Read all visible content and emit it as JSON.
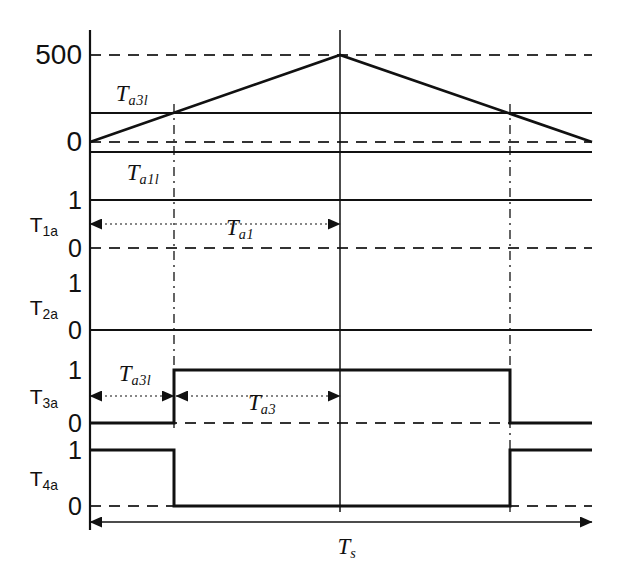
{
  "figure": {
    "type": "timing-diagram",
    "title_visible": false,
    "geometry": {
      "width": 617,
      "height": 576,
      "axis_x": 90,
      "right_edge": 592,
      "center_x": 340,
      "mark1_x": 174,
      "mark2_x": 510
    },
    "colors": {
      "line": "#111111",
      "dash": "#333333",
      "background": "#ffffff"
    }
  },
  "carrier": {
    "name": "triangular-carrier",
    "y_ticks": [
      {
        "label": "500",
        "y": 55
      },
      {
        "label": "0",
        "y": 142
      }
    ],
    "reference_levels": [
      {
        "name": "Ta3l-level",
        "y": 113
      },
      {
        "name": "Ta1l-level",
        "y": 152
      }
    ],
    "dashed_levels": [
      {
        "value": "500",
        "y": 55
      },
      {
        "value": "0",
        "y": 142
      }
    ],
    "waveform_points": [
      {
        "x": 90,
        "y": 142
      },
      {
        "x": 340,
        "y": 55
      },
      {
        "x": 592,
        "y": 142
      }
    ],
    "labels": [
      {
        "text": "T",
        "sub": "a3l",
        "x": 132,
        "y": 93
      },
      {
        "text": "T",
        "sub": "a1l",
        "x": 143,
        "y": 172
      }
    ]
  },
  "signals": [
    {
      "name": "T1a",
      "label_base": "T",
      "label_sub": "1a",
      "label_x": 58,
      "label_y": 224,
      "high_y": 200,
      "low_y": 248,
      "high_label": "1",
      "low_label": "0",
      "level_line_y": 200,
      "dashed_line_y": 248,
      "state": "high"
    },
    {
      "name": "T2a",
      "label_base": "T",
      "label_sub": "2a",
      "label_x": 58,
      "label_y": 307,
      "high_y": 283,
      "low_y": 330,
      "high_label": "1",
      "low_label": "0",
      "level_line_y": 330,
      "dashed_line_y": null,
      "state": "low"
    },
    {
      "name": "T3a",
      "label_base": "T",
      "label_sub": "3a",
      "label_x": 58,
      "label_y": 396,
      "high_y": 370,
      "low_y": 423,
      "high_label": "1",
      "low_label": "0",
      "dashed_line_y": 423,
      "state": "pulse-high-middle",
      "pulse": {
        "rise_x": 174,
        "fall_x": 510
      }
    },
    {
      "name": "T4a",
      "label_base": "T",
      "label_sub": "4a",
      "label_x": 58,
      "label_y": 478,
      "high_y": 450,
      "low_y": 506,
      "high_label": "1",
      "low_label": "0",
      "dashed_line_y": 506,
      "state": "pulse-low-middle",
      "pulse": {
        "fall_x": 174,
        "rise_x": 510
      }
    }
  ],
  "dimension_arrows": [
    {
      "name": "Ta1-span",
      "label": "T",
      "sub": "a1",
      "x1": 90,
      "x2": 340,
      "y": 224,
      "label_x": 240,
      "label_y": 227,
      "style": "dotted-double"
    },
    {
      "name": "Ta3l-span",
      "label": "T",
      "sub": "a3l",
      "x1": 90,
      "x2": 174,
      "y": 396,
      "label_x": 135,
      "label_y": 373,
      "style": "dotted-double"
    },
    {
      "name": "Ta3-span",
      "label": "T",
      "sub": "a3",
      "x1": 176,
      "x2": 340,
      "y": 396,
      "label_x": 262,
      "label_y": 402,
      "style": "dotted-double"
    },
    {
      "name": "Ts-span",
      "label": "T",
      "sub": "s",
      "x1": 90,
      "x2": 592,
      "y": 522,
      "label_x": 347,
      "label_y": 546,
      "style": "solid-double"
    }
  ],
  "vertical_markers": [
    {
      "name": "marker-center",
      "x": 340,
      "y1": 30,
      "y2": 512,
      "style": "solid"
    },
    {
      "name": "marker-ta3l",
      "x": 174,
      "y1": 104,
      "y2": 430,
      "style": "dash-dot"
    },
    {
      "name": "marker-ta3-end",
      "x": 510,
      "y1": 104,
      "y2": 512,
      "style": "dash-dot"
    }
  ],
  "y_axis": {
    "name": "y-axis",
    "x": 90,
    "y1": 30,
    "y2": 530
  }
}
